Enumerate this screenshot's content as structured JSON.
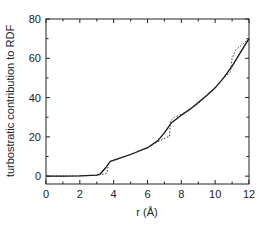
{
  "chart_data": {
    "type": "line",
    "title": "",
    "xlabel": "r (Å)",
    "ylabel": "turbostratic contribution to RDF",
    "xlim": [
      0,
      12
    ],
    "ylim": [
      -4,
      80
    ],
    "x_ticks": [
      0,
      2,
      4,
      6,
      8,
      10,
      12
    ],
    "y_ticks": [
      0,
      20,
      40,
      60,
      80
    ],
    "grid": false,
    "legend": null,
    "series": [
      {
        "name": "solid",
        "style": "solid",
        "color": "#111111",
        "points": [
          [
            0,
            0
          ],
          [
            1,
            0
          ],
          [
            2,
            0.1
          ],
          [
            3,
            0.5
          ],
          [
            3.2,
            1
          ],
          [
            3.5,
            4
          ],
          [
            3.8,
            7.5
          ],
          [
            4.2,
            8.7
          ],
          [
            5,
            11
          ],
          [
            6,
            14.5
          ],
          [
            6.6,
            18
          ],
          [
            7,
            22
          ],
          [
            7.4,
            27
          ],
          [
            8,
            31
          ],
          [
            8.5,
            34
          ],
          [
            9,
            37.5
          ],
          [
            9.5,
            41
          ],
          [
            10,
            45
          ],
          [
            10.5,
            50
          ],
          [
            11,
            56
          ],
          [
            11.5,
            63
          ],
          [
            12,
            70
          ]
        ]
      },
      {
        "name": "dotted",
        "style": "dotted",
        "color": "#333333",
        "points": [
          [
            0,
            0
          ],
          [
            1,
            0
          ],
          [
            2,
            0.1
          ],
          [
            3,
            0.5
          ],
          [
            3.4,
            1
          ],
          [
            3.6,
            1.5
          ],
          [
            3.7,
            6
          ],
          [
            3.8,
            7.5
          ],
          [
            4.2,
            8.7
          ],
          [
            5,
            11
          ],
          [
            6,
            14.5
          ],
          [
            6.6,
            17.5
          ],
          [
            7.2,
            20
          ],
          [
            7.3,
            20
          ],
          [
            7.35,
            28
          ],
          [
            7.6,
            30
          ],
          [
            8,
            31.5
          ],
          [
            8.5,
            34
          ],
          [
            9,
            37
          ],
          [
            9.5,
            41
          ],
          [
            10,
            45
          ],
          [
            10.5,
            50
          ],
          [
            10.9,
            53
          ],
          [
            11,
            60
          ],
          [
            11.2,
            64
          ],
          [
            11.6,
            67
          ],
          [
            12,
            70
          ]
        ]
      }
    ]
  },
  "axes": {
    "x_title": "r (Å)",
    "y_title": "turbostratic contribution to RDF",
    "x_tick_labels": [
      "0",
      "2",
      "4",
      "6",
      "8",
      "10",
      "12"
    ],
    "y_tick_labels": [
      "0",
      "20",
      "40",
      "60",
      "80"
    ]
  }
}
